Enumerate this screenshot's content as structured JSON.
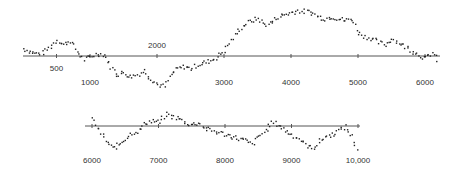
{
  "chart_data": {
    "type": "scatter",
    "title": "",
    "xlabel": "",
    "ylabel": "",
    "grid": false,
    "legend": null,
    "panels": [
      {
        "name": "top",
        "xlim": [
          0,
          6200
        ],
        "axis_y_px": 56,
        "x0_px": 23,
        "px_per_unit": 0.067,
        "ticks": [
          {
            "value": 500,
            "label": "500",
            "label_pos": "below-near"
          },
          {
            "value": 1000,
            "label": "1000",
            "label_pos": "below-far"
          },
          {
            "value": 2000,
            "label": "2000",
            "label_pos": "above"
          },
          {
            "value": 3000,
            "label": "3000",
            "label_pos": "below-far"
          },
          {
            "value": 4000,
            "label": "4000",
            "label_pos": "below-far"
          },
          {
            "value": 5000,
            "label": "5000",
            "label_pos": "below-far"
          },
          {
            "value": 6000,
            "label": "6000",
            "label_pos": "below-far"
          }
        ],
        "x": [
          0,
          100,
          200,
          300,
          400,
          500,
          600,
          700,
          800,
          900,
          1000,
          1100,
          1200,
          1300,
          1400,
          1500,
          1600,
          1700,
          1800,
          1900,
          2000,
          2100,
          2200,
          2300,
          2400,
          2500,
          2600,
          2700,
          2800,
          2900,
          3000,
          3100,
          3200,
          3300,
          3400,
          3500,
          3600,
          3700,
          3800,
          3900,
          4000,
          4100,
          4200,
          4300,
          4400,
          4500,
          4600,
          4700,
          4800,
          4900,
          5000,
          5100,
          5200,
          5300,
          5400,
          5500,
          5600,
          5700,
          5800,
          5900,
          6000,
          6100,
          6200
        ],
        "values": [
          8,
          5,
          3,
          4,
          10,
          17,
          12,
          16,
          5,
          -3,
          0,
          3,
          2,
          -10,
          -18,
          -16,
          -20,
          -18,
          -14,
          -22,
          -28,
          -30,
          -18,
          -12,
          -10,
          -12,
          -8,
          -6,
          -4,
          0,
          6,
          16,
          26,
          32,
          36,
          38,
          32,
          34,
          40,
          42,
          44,
          46,
          45,
          44,
          40,
          38,
          40,
          38,
          36,
          38,
          24,
          20,
          18,
          14,
          12,
          18,
          14,
          10,
          6,
          2,
          -2,
          4,
          -6
        ]
      },
      {
        "name": "bottom",
        "xlim": [
          5900,
          10000
        ],
        "axis_y_px": 126,
        "x0_px": 92,
        "x0_value": 6000,
        "px_per_unit": 0.0665,
        "ticks": [
          {
            "value": 6000,
            "label": "6000"
          },
          {
            "value": 7000,
            "label": "7000"
          },
          {
            "value": 8000,
            "label": "8000"
          },
          {
            "value": 9000,
            "label": "9000"
          },
          {
            "value": 10000,
            "label": "10,000"
          }
        ],
        "x": [
          6000,
          6100,
          6200,
          6300,
          6400,
          6500,
          6600,
          6700,
          6800,
          6900,
          7000,
          7100,
          7200,
          7300,
          7400,
          7500,
          7600,
          7700,
          7800,
          7900,
          8000,
          8100,
          8200,
          8300,
          8400,
          8500,
          8600,
          8700,
          8800,
          8900,
          9000,
          9100,
          9200,
          9300,
          9400,
          9500,
          9600,
          9700,
          9800,
          9900,
          10000
        ],
        "values": [
          8,
          -4,
          -14,
          -22,
          -18,
          -12,
          -6,
          -4,
          4,
          6,
          4,
          12,
          10,
          8,
          4,
          2,
          4,
          -2,
          -4,
          -6,
          -8,
          -10,
          -12,
          -14,
          -18,
          -10,
          -4,
          4,
          2,
          -4,
          -8,
          -12,
          -18,
          -22,
          -16,
          -10,
          -8,
          -4,
          0,
          -10,
          -26
        ]
      }
    ]
  }
}
